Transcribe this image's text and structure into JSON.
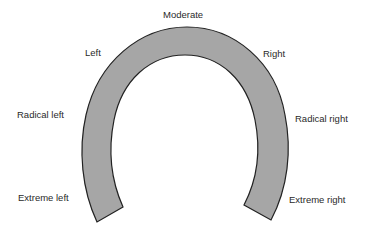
{
  "diagram": {
    "type": "horseshoe-spectrum",
    "band_fill": "#a6a6a6",
    "band_stroke": "#222222",
    "labels": {
      "moderate": "Moderate",
      "left": "Left",
      "right": "Right",
      "radical_left": "Radical left",
      "radical_right": "Radical right",
      "extreme_left": "Extreme left",
      "extreme_right": "Extreme right"
    }
  }
}
